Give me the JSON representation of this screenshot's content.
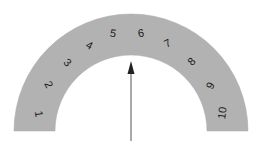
{
  "figure": {
    "name": "semicircular-scale-gauge",
    "background_color": "#ffffff",
    "band_color": "#b2b2b2",
    "band_edge_color": "#a8a8a8",
    "text_color": "#1a1a1a",
    "arrow_color": "#333333"
  },
  "chart_data": {
    "type": "gauge",
    "title": "",
    "subtitle": "",
    "xlabel": "",
    "ylabel": "",
    "grid": false,
    "legend": null,
    "center": {
      "x": 131,
      "y": 131
    },
    "outer_radius": 117,
    "inner_radius": 76,
    "start_angle_deg": 180,
    "end_angle_deg": 0,
    "categories": [
      "1",
      "2",
      "3",
      "4",
      "5",
      "6",
      "7",
      "8",
      "9",
      "10"
    ],
    "values": [
      1,
      2,
      3,
      4,
      5,
      6,
      7,
      8,
      9,
      10
    ],
    "tick_labels": [
      {
        "label": "1",
        "angle_deg": 171,
        "x": 38,
        "y": 114,
        "rotation_deg": 81,
        "radius": 95
      },
      {
        "label": "2",
        "angle_deg": 153,
        "x": 48,
        "y": 85,
        "rotation_deg": 63,
        "radius": 97
      },
      {
        "label": "3",
        "angle_deg": 135,
        "x": 67,
        "y": 63,
        "rotation_deg": 45,
        "radius": 96
      },
      {
        "label": "4",
        "angle_deg": 117,
        "x": 89,
        "y": 46,
        "rotation_deg": 27,
        "radius": 95
      },
      {
        "label": "5",
        "angle_deg": 99,
        "x": 113,
        "y": 34,
        "rotation_deg": 9,
        "radius": 98
      },
      {
        "label": "6",
        "angle_deg": 81,
        "x": 141,
        "y": 34,
        "rotation_deg": -9,
        "radius": 98
      },
      {
        "label": "7",
        "angle_deg": 63,
        "x": 168,
        "y": 44,
        "rotation_deg": -27,
        "radius": 96
      },
      {
        "label": "8",
        "angle_deg": 45,
        "x": 192,
        "y": 62,
        "rotation_deg": -45,
        "radius": 97
      },
      {
        "label": "9",
        "angle_deg": 27,
        "x": 211,
        "y": 86,
        "rotation_deg": -63,
        "radius": 92
      },
      {
        "label": "10",
        "angle_deg": 9,
        "x": 223,
        "y": 113,
        "rotation_deg": -81,
        "radius": 94
      }
    ],
    "pointer": {
      "label": "",
      "value": 5.5,
      "angle_deg": 90,
      "tail": {
        "x": 131,
        "y": 141
      },
      "tip": {
        "x": 131,
        "y": 61
      },
      "head_width": 7,
      "head_length": 13,
      "shaft_width": 1
    },
    "annotations": []
  }
}
